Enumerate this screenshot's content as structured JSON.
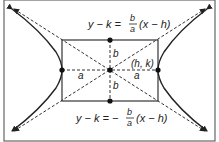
{
  "diagram": {
    "upper_asymptote": {
      "lhs": "y − k = ",
      "num": "b",
      "den": "a",
      "rhs": "(x − h)"
    },
    "lower_asymptote": {
      "lhs": "y − k = −",
      "num": "b",
      "den": "a",
      "rhs": "(x − h)"
    },
    "labels": {
      "center": "(h, k)",
      "b_top": "b",
      "b_bottom": "b",
      "a_left": "a",
      "a_right": "a"
    },
    "colors": {
      "stroke": "#333333",
      "border": "#555555",
      "background": "#ffffff"
    }
  }
}
